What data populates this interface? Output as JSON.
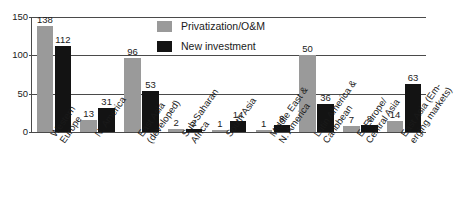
{
  "chart_data": {
    "type": "bar",
    "title": "",
    "xlabel": "",
    "ylabel": "",
    "ylim": [
      0,
      150
    ],
    "yticks": [
      0,
      50,
      100,
      150
    ],
    "grid": true,
    "legend_position": "top-center",
    "categories": [
      "Western Europe",
      "N. America",
      "East Asia (developed)",
      "Sub-Saharan Africa",
      "South Asia",
      "Middle East & N. America",
      "Latin America & Caribbean",
      "E. Europe/ Central Asia",
      "East Asia (Emerging markets)"
    ],
    "category_lines": [
      [
        "Western",
        "Europe"
      ],
      [
        "N. America"
      ],
      [
        "East Asia",
        "(developed)"
      ],
      [
        "Sub-Saharan",
        "Africa"
      ],
      [
        "South Asia"
      ],
      [
        "Middle East &",
        "N. America"
      ],
      [
        "Latin America &",
        "Caribbean"
      ],
      [
        "E. Europe/",
        "Central Asia"
      ],
      [
        "East Asia (Em-",
        "erging markets)"
      ]
    ],
    "series": [
      {
        "name": "Privatization/O&M",
        "color": "#9a9a9a",
        "values": [
          138,
          13,
          96,
          2,
          1,
          1,
          50,
          7,
          14
        ],
        "drawn_heights": [
          138,
          16,
          96,
          4,
          3,
          3,
          100,
          8,
          15
        ]
      },
      {
        "name": "New investment",
        "color": "#131313",
        "values": [
          112,
          31,
          53,
          2,
          14,
          8,
          36,
          8,
          63
        ],
        "drawn_heights": [
          112,
          31,
          53,
          4,
          14,
          9,
          36,
          9,
          63
        ]
      }
    ]
  },
  "legend": {
    "items": [
      {
        "label": "Privatization/O&M",
        "color": "#9a9a9a"
      },
      {
        "label": "New investment",
        "color": "#131313"
      }
    ]
  },
  "axis": {
    "y_tick_labels": [
      "150",
      "100",
      "50",
      "0"
    ]
  }
}
